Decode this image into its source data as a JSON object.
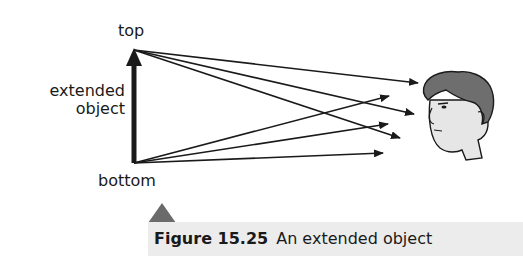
{
  "labels": {
    "top": "top",
    "object_line1": "extended",
    "object_line2": "object",
    "bottom": "bottom"
  },
  "caption": {
    "number": "Figure 15.25",
    "text": "An extended object"
  },
  "colors": {
    "ink": "#1a1a1a",
    "caption_bg": "#ececec",
    "triangle": "#6b6b6b",
    "hair": "#6e6e6e",
    "skin": "#e6e6e6"
  },
  "diagram": {
    "object_arrow": {
      "from": [
        134,
        163
      ],
      "to": [
        134,
        50
      ]
    },
    "rays_from_top": [
      [
        418,
        83
      ],
      [
        414,
        114
      ],
      [
        400,
        138
      ]
    ],
    "rays_from_bottom": [
      [
        389,
        96
      ],
      [
        388,
        124
      ],
      [
        383,
        153
      ]
    ]
  }
}
